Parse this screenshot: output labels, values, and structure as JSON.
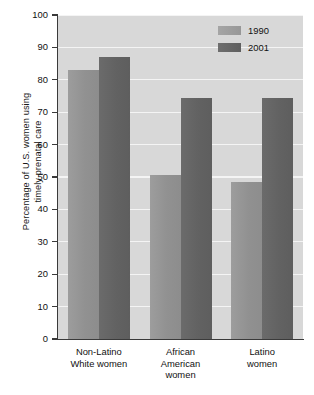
{
  "chart_data": {
    "type": "bar",
    "title": "",
    "xlabel": "",
    "ylabel": "Percentage of U.S. women using\ntimely prenatal care",
    "ylim": [
      0,
      100
    ],
    "yticks": [
      0,
      10,
      20,
      30,
      40,
      50,
      60,
      70,
      80,
      90,
      100
    ],
    "ytick_labels": [
      "0",
      "10",
      "20",
      "30",
      "40",
      "50",
      "60",
      "70",
      "80",
      "90",
      "100"
    ],
    "grid": "horizontal",
    "legend_position": "top-right",
    "categories": [
      "Non-Latino\nWhite women",
      "African\nAmerican\nwomen",
      "Latino\nwomen"
    ],
    "series": [
      {
        "name": "1990",
        "color": "#939393",
        "values": [
          83.0,
          50.5,
          48.5
        ]
      },
      {
        "name": "2001",
        "color": "#636363",
        "values": [
          87.0,
          74.5,
          74.5
        ]
      }
    ],
    "plot_background": "#d8d8d8",
    "gridline_color": "#f4f4f4",
    "axis_color": "#3a3a3a"
  }
}
